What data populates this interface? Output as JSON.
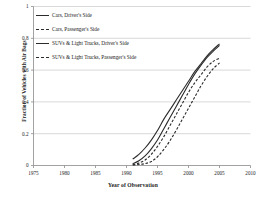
{
  "chart_data": {
    "type": "line",
    "title": "",
    "xlabel": "Year of Observation",
    "ylabel": "Fraction of Vehicles with Air Bags",
    "xlim": [
      1975,
      2010
    ],
    "ylim": [
      0,
      1
    ],
    "xticks": [
      "1975",
      "1980",
      "1985",
      "1990",
      "1995",
      "2000",
      "2005",
      "2010"
    ],
    "yticks": [
      "0",
      "0.2",
      "0.4",
      "0.6",
      "0.8",
      "1"
    ],
    "grid": "horizontal",
    "legend_position": "upper-left",
    "line_color": "#2b2b2b",
    "gridline_color": "#c9c9c9",
    "axis_color": "#8a8a8a",
    "series": [
      {
        "name": "Cars, Driver's Side",
        "style": "solid",
        "x": [
          1991,
          1992,
          1993,
          1994,
          1995,
          1996,
          1997,
          1998,
          1999,
          2000,
          2001,
          2002,
          2003,
          2004,
          2005
        ],
        "values": [
          0.04,
          0.07,
          0.11,
          0.16,
          0.22,
          0.29,
          0.35,
          0.41,
          0.47,
          0.53,
          0.59,
          0.64,
          0.69,
          0.73,
          0.765
        ]
      },
      {
        "name": "Cars, Passenger's Side",
        "style": "dashed",
        "x": [
          1991,
          1992,
          1993,
          1994,
          1995,
          1996,
          1997,
          1998,
          1999,
          2000,
          2001,
          2002,
          2003,
          2004,
          2005
        ],
        "values": [
          0.005,
          0.015,
          0.035,
          0.07,
          0.12,
          0.18,
          0.25,
          0.32,
          0.39,
          0.46,
          0.52,
          0.57,
          0.62,
          0.655,
          0.675
        ]
      },
      {
        "name": "SUVs & Light Trucks, Driver's Side",
        "style": "solid",
        "x": [
          1991,
          1992,
          1993,
          1994,
          1995,
          1996,
          1997,
          1998,
          1999,
          2000,
          2001,
          2002,
          2003,
          2004,
          2005
        ],
        "values": [
          0.01,
          0.03,
          0.06,
          0.105,
          0.16,
          0.23,
          0.3,
          0.37,
          0.44,
          0.51,
          0.575,
          0.63,
          0.68,
          0.72,
          0.755
        ]
      },
      {
        "name": "SUVs & Light Trucks, Passenger's Side",
        "style": "dashed",
        "x": [
          1991,
          1992,
          1993,
          1994,
          1995,
          1996,
          1997,
          1998,
          1999,
          2000,
          2001,
          2002,
          2003,
          2004,
          2005
        ],
        "values": [
          0.003,
          0.006,
          0.012,
          0.025,
          0.055,
          0.1,
          0.155,
          0.22,
          0.29,
          0.36,
          0.43,
          0.5,
          0.56,
          0.61,
          0.645
        ]
      }
    ]
  },
  "legend": {
    "items": [
      {
        "label": "Cars, Driver's Side",
        "style": "solid"
      },
      {
        "label": "Cars, Passenger's Side",
        "style": "dashed"
      },
      {
        "label": "SUVs & Light Trucks, Driver's Side",
        "style": "solid"
      },
      {
        "label": "SUVs & Light Trucks, Passenger's Side",
        "style": "dashed"
      }
    ]
  }
}
